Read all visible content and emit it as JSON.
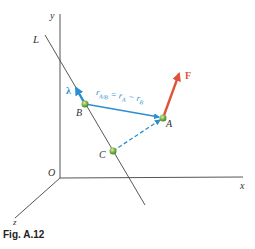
{
  "figure": {
    "caption": "Fig. A.12",
    "axes": {
      "x_label": "x",
      "y_label": "y",
      "z_label": "z",
      "origin_label": "O"
    },
    "line_label": "L",
    "points": [
      {
        "name": "A",
        "label": "A"
      },
      {
        "name": "B",
        "label": "B"
      },
      {
        "name": "C",
        "label": "C"
      }
    ],
    "vectors": {
      "force_label": "F",
      "unit_vector_label": "λ",
      "relative_position": {
        "r": "r",
        "sub_ab": "A/B",
        "equals": " = ",
        "r_a": "r",
        "sub_a": "A",
        "minus": " − ",
        "r_b": "r",
        "sub_b": "B"
      }
    },
    "colors": {
      "axis": "#555555",
      "line_L": "#444444",
      "vector_blue": "#2a8fd0",
      "force_red": "#e0553a",
      "point_green": "#7cb342"
    }
  }
}
